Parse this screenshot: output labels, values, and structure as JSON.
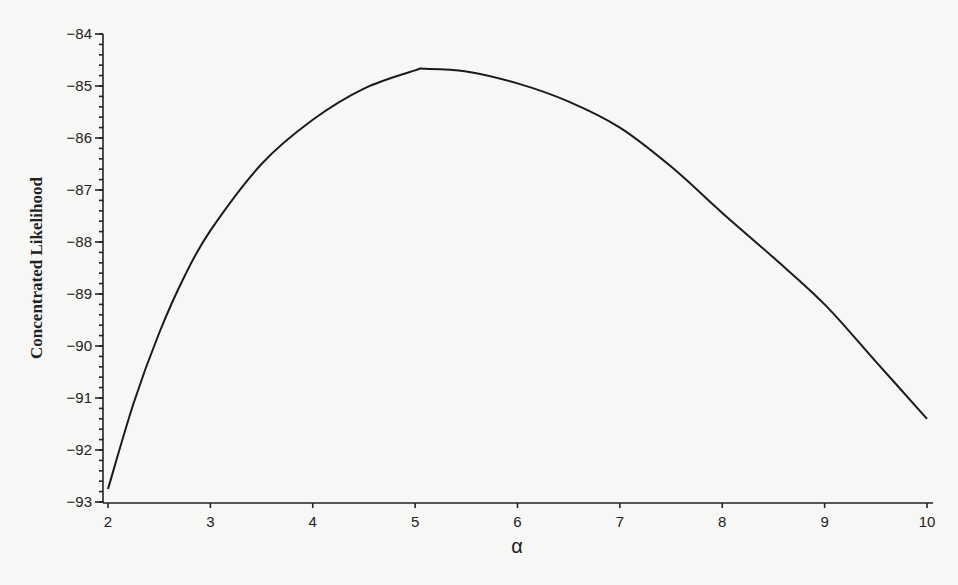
{
  "chart_data": {
    "type": "line",
    "title": "",
    "xlabel": "α",
    "ylabel": "Concentrated Likelihood",
    "xlim": [
      2,
      10
    ],
    "ylim": [
      -93,
      -84
    ],
    "grid": false,
    "legend": null,
    "x_ticks": [
      "2",
      "3",
      "4",
      "5",
      "6",
      "7",
      "8",
      "9",
      "10"
    ],
    "y_ticks": [
      "-84",
      "-85",
      "-86",
      "-87",
      "-88",
      "-89",
      "-90",
      "-91",
      "-92",
      "-93"
    ],
    "y_minor_tick_step": 0.2,
    "series": [
      {
        "name": "Concentrated Likelihood",
        "x": [
          2.0,
          2.25,
          2.5,
          2.75,
          3.0,
          3.5,
          4.0,
          4.5,
          5.0,
          5.1,
          5.5,
          6.0,
          6.5,
          7.0,
          7.5,
          8.0,
          8.5,
          9.0,
          9.5,
          10.0
        ],
        "y": [
          -92.75,
          -91.1,
          -89.75,
          -88.65,
          -87.78,
          -86.5,
          -85.65,
          -85.05,
          -84.7,
          -84.67,
          -84.72,
          -84.95,
          -85.3,
          -85.8,
          -86.55,
          -87.44,
          -88.3,
          -89.2,
          -90.3,
          -91.4
        ]
      }
    ]
  },
  "labels": {
    "y_axis_title": "Concentrated Likelihood",
    "x_axis_title": "α"
  }
}
